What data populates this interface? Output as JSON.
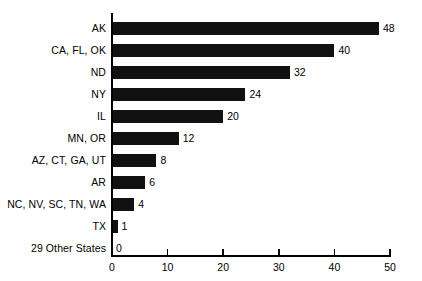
{
  "chart_data": {
    "type": "bar",
    "orientation": "horizontal",
    "title": "",
    "xlabel": "",
    "ylabel": "",
    "categories": [
      "AK",
      "CA, FL, OK",
      "ND",
      "NY",
      "IL",
      "MN, OR",
      "AZ, CT, GA, UT",
      "AR",
      "NC, NV, SC, TN, WA",
      "TX",
      "29 Other States"
    ],
    "values": [
      48,
      40,
      32,
      24,
      20,
      12,
      8,
      6,
      4,
      1,
      0
    ],
    "value_labels": [
      "48",
      "40",
      "32",
      "24",
      "20",
      "12",
      "8",
      "6",
      "4",
      "1",
      "0"
    ],
    "xlim": [
      0,
      50
    ],
    "xticks": [
      0,
      10,
      20,
      30,
      40,
      50
    ],
    "xtick_labels": [
      "0",
      "10",
      "20",
      "30",
      "40",
      "50"
    ],
    "grid": false,
    "legend": null,
    "bar_color": "#111111",
    "axis_color": "#000000",
    "background_color": "#ffffff"
  }
}
